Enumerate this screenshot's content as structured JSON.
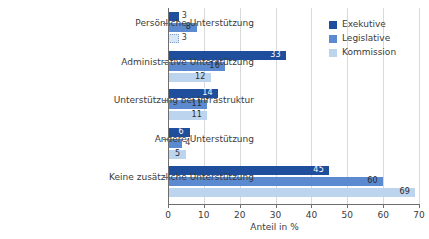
{
  "chart_data": {
    "type": "bar",
    "orientation": "horizontal",
    "title": "",
    "subtitle": "",
    "xlabel": "Anteil in %",
    "ylabel": "",
    "xlim": [
      0,
      70
    ],
    "xticks": [
      0,
      10,
      20,
      30,
      40,
      50,
      60,
      70
    ],
    "xtick_labels": [
      "0",
      "10",
      "20",
      "30",
      "40",
      "50",
      "60",
      "70"
    ],
    "grid": "vertical",
    "legend_position": "top-right",
    "categories": [
      "Persönliche Unterstützung",
      "Administrative Unterstützung",
      "Unterstützung bei Infrastruktur",
      "Andere Unterstützung",
      "Keine zusätzliche Unterstützung"
    ],
    "series": [
      {
        "name": "Exekutive",
        "color": "#1f4e9c",
        "values": [
          3,
          33,
          14,
          6,
          45
        ]
      },
      {
        "name": "Legislative",
        "color": "#5b8ad0",
        "values": [
          8,
          16,
          11,
          4,
          60
        ]
      },
      {
        "name": "Kommission",
        "color": "#bdd4ee",
        "values": [
          3,
          12,
          11,
          5,
          69
        ]
      }
    ],
    "data_labels": [
      [
        "3",
        "8",
        "3"
      ],
      [
        "33",
        "16",
        "12"
      ],
      [
        "14",
        "11",
        "11"
      ],
      [
        "6",
        "4",
        "5"
      ],
      [
        "45",
        "60",
        "69"
      ]
    ]
  },
  "legend": {
    "items": [
      {
        "label": "Exekutive",
        "color": "#1f4e9c"
      },
      {
        "label": "Legislative",
        "color": "#5b8ad0"
      },
      {
        "label": "Kommission",
        "color": "#bdd4ee"
      }
    ]
  },
  "axis": {
    "x_title": "Anteil in %"
  },
  "colors": {
    "series_dark": "#1f4e9c",
    "series_mid": "#5b8ad0",
    "series_light": "#bdd4ee",
    "axis": "#6e6e6e",
    "grid": "#d9d9d9",
    "text": "#3b3b3b"
  }
}
